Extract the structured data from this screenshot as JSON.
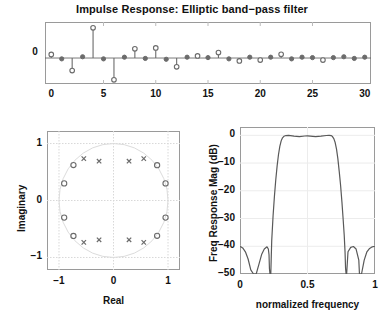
{
  "figure": {
    "title": "Impulse Response: Elliptic band−pass filter",
    "background": "#ffffff",
    "line_color": "#595959",
    "marker_color": "#6b6b6b",
    "axis_color": "#9a9a9a",
    "grid_color": "#d8d8d8"
  },
  "chart_data": [
    {
      "type": "line",
      "name": "impulse-response",
      "title": "Impulse Response: Elliptic band−pass filter",
      "xlabel": "",
      "ylabel": "",
      "xlim": [
        -0.6,
        30.6
      ],
      "ylim": [
        -0.62,
        0.86
      ],
      "xticks": [
        0,
        5,
        10,
        15,
        20,
        25,
        30
      ],
      "xticklabels": [
        "0",
        "5",
        "10",
        "15",
        "20",
        "25",
        "30"
      ],
      "yticks": [
        0
      ],
      "yticklabels": [
        "0"
      ],
      "grid": false,
      "marker": "circle-open",
      "x": [
        0,
        1,
        2,
        3,
        4,
        5,
        6,
        7,
        8,
        9,
        10,
        11,
        12,
        13,
        14,
        15,
        16,
        17,
        18,
        19,
        20,
        21,
        22,
        23,
        24,
        25,
        26,
        27,
        28,
        29,
        30
      ],
      "values": [
        0.085,
        -0.02,
        -0.3,
        0.03,
        0.72,
        -0.02,
        -0.52,
        0.02,
        0.22,
        -0.01,
        0.24,
        -0.03,
        -0.21,
        0.02,
        0.05,
        0.01,
        0.13,
        -0.02,
        -0.07,
        0.02,
        -0.05,
        0.02,
        0.09,
        -0.02,
        0.02,
        0.01,
        -0.05,
        0.01,
        0.03,
        -0.01,
        0.02
      ]
    },
    {
      "type": "scatter",
      "name": "pole-zero-plot",
      "title": "",
      "xlabel": "Real",
      "ylabel": "Imaginary",
      "xlim": [
        -1.22,
        1.22
      ],
      "ylim": [
        -1.22,
        1.22
      ],
      "xticks": [
        -1,
        0,
        1
      ],
      "xticklabels": [
        "−1",
        "0",
        "1"
      ],
      "yticks": [
        -1,
        0,
        1
      ],
      "yticklabels": [
        "1",
        "0",
        "−1"
      ],
      "grid": true,
      "unit_circle": true,
      "series": [
        {
          "name": "zeros",
          "marker": "circle-open",
          "points": [
            [
              -0.905,
              0.3
            ],
            [
              -0.735,
              0.622
            ],
            [
              0.8,
              0.62
            ],
            [
              0.955,
              0.3
            ],
            [
              0.955,
              -0.3
            ],
            [
              0.8,
              -0.62
            ],
            [
              -0.735,
              -0.622
            ],
            [
              -0.905,
              -0.3
            ]
          ]
        },
        {
          "name": "poles",
          "marker": "x",
          "points": [
            [
              -0.545,
              0.735
            ],
            [
              -0.265,
              0.69
            ],
            [
              0.285,
              0.69
            ],
            [
              0.555,
              0.735
            ],
            [
              0.555,
              -0.735
            ],
            [
              0.285,
              -0.69
            ],
            [
              -0.265,
              -0.69
            ],
            [
              -0.545,
              -0.735
            ]
          ]
        }
      ]
    },
    {
      "type": "line",
      "name": "frequency-response",
      "title": "",
      "xlabel": "normalized frequency",
      "ylabel": "Freq Response Mag (dB)",
      "xlim": [
        0,
        1
      ],
      "ylim": [
        -50,
        3
      ],
      "xticks": [
        0,
        0.5,
        1
      ],
      "xticklabels": [
        "0",
        "0.5",
        "1"
      ],
      "yticks": [
        0,
        -10,
        -20,
        -30,
        -40,
        -50
      ],
      "yticklabels": [
        "0",
        "−10",
        "−20",
        "−30",
        "−40",
        "−50"
      ],
      "grid": true,
      "x": [
        0.0,
        0.02,
        0.04,
        0.06,
        0.08,
        0.1,
        0.105,
        0.11,
        0.115,
        0.12,
        0.14,
        0.16,
        0.18,
        0.2,
        0.21,
        0.215,
        0.218,
        0.222,
        0.228,
        0.235,
        0.245,
        0.255,
        0.265,
        0.275,
        0.285,
        0.295,
        0.305,
        0.315,
        0.325,
        0.34,
        0.36,
        0.4,
        0.44,
        0.48,
        0.5,
        0.52,
        0.56,
        0.6,
        0.64,
        0.66,
        0.675,
        0.685,
        0.695,
        0.705,
        0.715,
        0.725,
        0.735,
        0.745,
        0.755,
        0.765,
        0.772,
        0.778,
        0.782,
        0.786,
        0.79,
        0.8,
        0.82,
        0.84,
        0.86,
        0.88,
        0.885,
        0.89,
        0.895,
        0.9,
        0.92,
        0.94,
        0.96,
        0.98,
        1.0
      ],
      "values": [
        -40.0,
        -40.6,
        -42.0,
        -44.6,
        -48.5,
        -56.0,
        -60.0,
        -66.0,
        -60.0,
        -55.0,
        -46.5,
        -43.0,
        -41.0,
        -40.2,
        -41.0,
        -43.0,
        -48.0,
        -58.0,
        -52.0,
        -38.0,
        -29.0,
        -22.0,
        -16.0,
        -11.0,
        -7.0,
        -4.0,
        -2.0,
        -0.9,
        -0.35,
        -0.08,
        -0.02,
        -0.3,
        -0.45,
        -0.25,
        -0.18,
        -0.26,
        -0.45,
        -0.32,
        -0.06,
        -0.02,
        -0.1,
        -0.45,
        -1.2,
        -2.6,
        -5.0,
        -8.5,
        -13.0,
        -18.0,
        -24.0,
        -31.0,
        -36.0,
        -42.0,
        -48.0,
        -58.0,
        -50.0,
        -42.0,
        -40.4,
        -40.1,
        -41.0,
        -45.0,
        -50.0,
        -58.0,
        -66.0,
        -57.0,
        -45.0,
        -42.0,
        -40.8,
        -40.2,
        -40.0
      ]
    }
  ],
  "stem_axis": {
    "xticklabels": [
      "0",
      "5",
      "10",
      "15",
      "20",
      "25",
      "30"
    ],
    "yticklabel_zero": "0"
  },
  "pz_axis": {
    "xticklabels": [
      "−1",
      "0",
      "1"
    ],
    "yticklabels": [
      "1",
      "0",
      "−1"
    ],
    "xlabel": "Real",
    "ylabel": "Imaginary"
  },
  "fr_axis": {
    "xticklabels": [
      "0",
      "0.5",
      "1"
    ],
    "yticklabels": [
      "0",
      "−10",
      "−20",
      "−30",
      "−40",
      "−50"
    ],
    "xlabel": "normalized frequency",
    "ylabel": "Freq Response Mag (dB)"
  }
}
